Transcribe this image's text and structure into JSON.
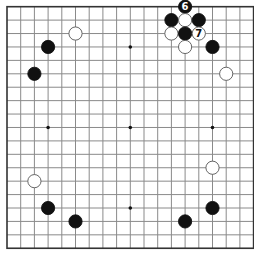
{
  "board": {
    "size": 19,
    "origin_x": 7,
    "origin_y": 6.7,
    "step_x": 13.7,
    "step_y": 13.42,
    "line_color": "#8a8a8a",
    "border_color": "#333333",
    "background": "#ffffff",
    "star_points": [
      [
        3,
        3
      ],
      [
        9,
        3
      ],
      [
        15,
        3
      ],
      [
        3,
        9
      ],
      [
        9,
        9
      ],
      [
        15,
        9
      ],
      [
        3,
        15
      ],
      [
        9,
        15
      ],
      [
        15,
        15
      ]
    ]
  },
  "stones": [
    {
      "color": "white",
      "col": 5,
      "row": 2
    },
    {
      "color": "black",
      "col": 3,
      "row": 3
    },
    {
      "color": "black",
      "col": 2,
      "row": 5
    },
    {
      "color": "black",
      "col": 13,
      "row": 0,
      "label": "6"
    },
    {
      "color": "black",
      "col": 12,
      "row": 1
    },
    {
      "color": "white",
      "col": 13,
      "row": 1
    },
    {
      "color": "black",
      "col": 14,
      "row": 1
    },
    {
      "color": "white",
      "col": 12,
      "row": 2
    },
    {
      "color": "black",
      "col": 13,
      "row": 2
    },
    {
      "color": "white",
      "col": 14,
      "row": 2,
      "label": "7"
    },
    {
      "color": "white",
      "col": 13,
      "row": 3
    },
    {
      "color": "black",
      "col": 15,
      "row": 3
    },
    {
      "color": "white",
      "col": 16,
      "row": 5
    },
    {
      "color": "white",
      "col": 2,
      "row": 13
    },
    {
      "color": "white",
      "col": 15,
      "row": 12
    },
    {
      "color": "black",
      "col": 3,
      "row": 15
    },
    {
      "color": "black",
      "col": 15,
      "row": 15
    },
    {
      "color": "black",
      "col": 5,
      "row": 16
    },
    {
      "color": "black",
      "col": 13,
      "row": 16
    }
  ]
}
